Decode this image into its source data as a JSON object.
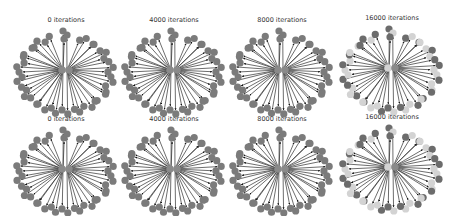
{
  "figure": {
    "rows": 2,
    "cols": 4,
    "panels": [
      {
        "title": "0 iterations",
        "row": 0,
        "col": 0,
        "x": 9,
        "y": 16,
        "mode": "uniform"
      },
      {
        "title": "4000 iterations",
        "row": 0,
        "col": 1,
        "x": 117,
        "y": 16,
        "mode": "uniform"
      },
      {
        "title": "8000 iterations",
        "row": 0,
        "col": 2,
        "x": 225,
        "y": 16,
        "mode": "uniform"
      },
      {
        "title": "16000 iterations",
        "row": 0,
        "col": 3,
        "x": 335,
        "y": 14,
        "mode": "mixed"
      },
      {
        "title": "0 iterations",
        "row": 1,
        "col": 0,
        "x": 9,
        "y": 115,
        "mode": "uniform"
      },
      {
        "title": "4000 iterations",
        "row": 1,
        "col": 1,
        "x": 117,
        "y": 115,
        "mode": "uniform"
      },
      {
        "title": "8000 iterations",
        "row": 1,
        "col": 2,
        "x": 225,
        "y": 115,
        "mode": "uniform"
      },
      {
        "title": "16000 iterations",
        "row": 1,
        "col": 3,
        "x": 335,
        "y": 113,
        "mode": "mixed"
      }
    ]
  },
  "graph": {
    "type": "star",
    "hub_count": 2,
    "peripheral_nodes": 44,
    "colors": {
      "node_default": "#7b7b7b",
      "node_dark": "#6c6c6c",
      "node_light": "#d3d3d3",
      "edge": "#2e2e2e",
      "hub": "#8a8a8a"
    },
    "mixed_pattern": [
      1,
      0,
      1,
      0,
      0,
      1,
      0,
      1,
      1,
      0,
      0,
      1,
      0,
      0,
      1,
      1,
      0,
      1,
      0,
      0,
      1,
      0,
      1,
      1,
      0,
      0,
      1,
      0,
      1,
      0,
      0,
      1,
      1,
      0,
      0,
      1,
      0,
      1,
      0,
      0,
      1,
      1,
      0,
      1
    ]
  }
}
